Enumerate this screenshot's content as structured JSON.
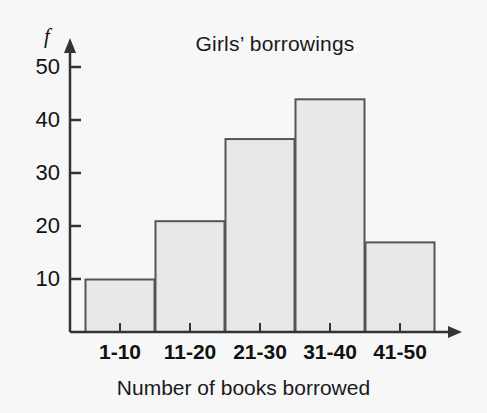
{
  "chart_data": {
    "type": "bar",
    "title": "Girls’ borrowings",
    "xlabel": "Number of books borrowed",
    "ylabel": "f",
    "categories": [
      "1-10",
      "11-20",
      "21-30",
      "31-40",
      "41-50"
    ],
    "values": [
      10,
      21,
      36.5,
      44,
      17
    ],
    "ylim": [
      0,
      52
    ],
    "yticks": [
      10,
      20,
      30,
      40,
      50
    ],
    "ytick_labels": [
      "10",
      "20",
      "30",
      "40",
      "50"
    ],
    "grid": false,
    "legend": null,
    "bar_fill_color": "#e8e8e8",
    "bar_edge_color": "#555555",
    "axis_color": "#333333",
    "background_color": "#f7f7f7",
    "axis_style": "arrow-ended axes, ticks outside, no gridlines"
  }
}
